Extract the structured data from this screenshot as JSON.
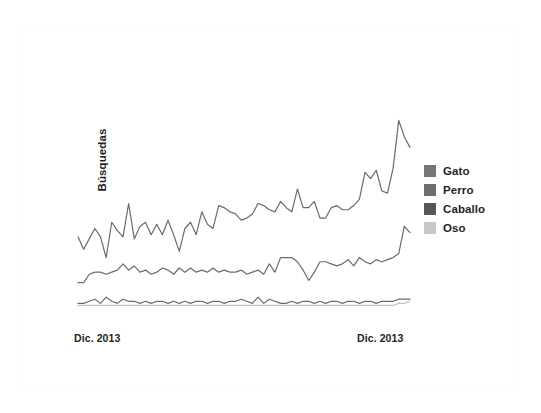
{
  "figure": {
    "background_color": "#ffffff",
    "frame_color": "#fcfcfc"
  },
  "legend": {
    "position": "right",
    "items": [
      {
        "label": "Gato",
        "color": "#767676",
        "icon": "legend-swatch-icon"
      },
      {
        "label": "Perro",
        "color": "#6e6e6e",
        "icon": "legend-swatch-icon"
      },
      {
        "label": "Caballo",
        "color": "#565656",
        "icon": "legend-swatch-icon"
      },
      {
        "label": "Oso",
        "color": "#c8c8c8",
        "icon": "legend-swatch-icon"
      }
    ]
  },
  "axes": {
    "ylabel": "Búsquedas",
    "xlabel": "",
    "x_ticks": [
      "Dic. 2013",
      "Dic. 2013"
    ]
  },
  "chart_data": {
    "type": "line",
    "title": "",
    "subtitle": "",
    "xlabel": "",
    "ylabel": "Búsquedas",
    "xlim": [
      0,
      59
    ],
    "ylim": [
      0,
      100
    ],
    "grid": false,
    "legend_position": "right",
    "axis_ticks_visible": false,
    "x_tick_labels": [
      "Dic. 2013",
      "Dic. 2013"
    ],
    "x_tick_positions": [
      0,
      52
    ],
    "note": "Google-Trends style relative search interest; y axis unlabeled/unitless. Values estimated from pixel positions.",
    "x": [
      0,
      1,
      2,
      3,
      4,
      5,
      6,
      7,
      8,
      9,
      10,
      11,
      12,
      13,
      14,
      15,
      16,
      17,
      18,
      19,
      20,
      21,
      22,
      23,
      24,
      25,
      26,
      27,
      28,
      29,
      30,
      31,
      32,
      33,
      34,
      35,
      36,
      37,
      38,
      39,
      40,
      41,
      42,
      43,
      44,
      45,
      46,
      47,
      48,
      49,
      50,
      51,
      52,
      53,
      54,
      55,
      56,
      57,
      58,
      59
    ],
    "series": [
      {
        "name": "Gato",
        "color": "#6b6b6b",
        "values": [
          40,
          34,
          39,
          44,
          40,
          30,
          47,
          43,
          40,
          56,
          39,
          45,
          47,
          41,
          46,
          41,
          48,
          41,
          33,
          44,
          47,
          41,
          52,
          46,
          44,
          55,
          54,
          52,
          51,
          48,
          49,
          51,
          56,
          55,
          53,
          52,
          57,
          54,
          52,
          63,
          54,
          54,
          57,
          49,
          49,
          54,
          55,
          53,
          53,
          55,
          58,
          71,
          68,
          72,
          62,
          61,
          73,
          96,
          88,
          83
        ]
      },
      {
        "name": "Perro",
        "color": "#6b6b6b",
        "values": [
          18,
          18,
          22,
          23,
          23,
          22,
          23,
          24,
          27,
          24,
          26,
          23,
          24,
          22,
          23,
          25,
          24,
          22,
          25,
          23,
          25,
          23,
          24,
          23,
          25,
          23,
          24,
          23,
          23,
          24,
          22,
          23,
          24,
          22,
          27,
          23,
          30,
          30,
          30,
          28,
          24,
          19,
          23,
          28,
          28,
          27,
          26,
          27,
          29,
          26,
          30,
          28,
          27,
          29,
          28,
          29,
          30,
          32,
          45,
          42
        ]
      },
      {
        "name": "Caballo",
        "color": "#6b6b6b",
        "values": [
          8,
          8,
          9,
          10,
          8,
          11,
          9,
          8,
          10,
          9,
          9,
          8,
          9,
          8,
          9,
          9,
          8,
          9,
          8,
          9,
          8,
          9,
          9,
          8,
          9,
          9,
          8,
          9,
          9,
          10,
          9,
          8,
          11,
          8,
          10,
          9,
          8,
          8,
          9,
          8,
          9,
          9,
          8,
          9,
          8,
          9,
          9,
          8,
          9,
          9,
          8,
          9,
          9,
          8,
          9,
          9,
          9,
          10,
          10,
          10
        ]
      },
      {
        "name": "Oso",
        "color": "#c0c0c0",
        "values": [
          7,
          7,
          7,
          7,
          7,
          7,
          7,
          7,
          7,
          7,
          7,
          7,
          7,
          7,
          7,
          7,
          7,
          7,
          7,
          7,
          7,
          7,
          7,
          7,
          7,
          7,
          7,
          7,
          7,
          7,
          7,
          7,
          7,
          7,
          7,
          7,
          7,
          7,
          7,
          7,
          7,
          7,
          7,
          7,
          7,
          7,
          7,
          7,
          7,
          7,
          7,
          7,
          7,
          7,
          7,
          7,
          7,
          8,
          8,
          9
        ]
      }
    ]
  }
}
